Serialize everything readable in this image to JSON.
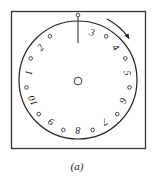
{
  "figure": {
    "caption": "(a)",
    "dial": {
      "numbers_clockwise_from_pointer": [
        "3",
        "4",
        "5",
        "6",
        "7",
        "8",
        "9",
        "10",
        "1",
        "2"
      ],
      "hole_count": 11,
      "rotation_direction": "clockwise",
      "has_center_hole": true,
      "has_top_pointer": true
    },
    "colors": {
      "stroke": "#222222",
      "background": "#ffffff"
    }
  }
}
